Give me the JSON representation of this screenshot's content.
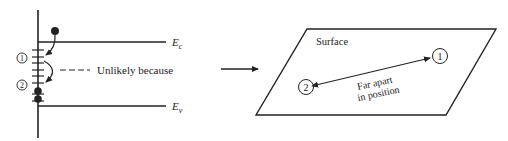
{
  "left_panel": {
    "conduction_band_label": "E",
    "conduction_band_sub": "c",
    "valence_band_label": "E",
    "valence_band_sub": "v",
    "state_1_label": "1",
    "state_2_label": "2",
    "note": "Unlikely because"
  },
  "right_panel": {
    "surface_label": "Surface",
    "site_1_label": "1",
    "site_2_label": "2",
    "distance_label_line1": "Far apart",
    "distance_label_line2": "in position"
  },
  "colors": {
    "ink": "#222222",
    "background": "#ffffff"
  }
}
